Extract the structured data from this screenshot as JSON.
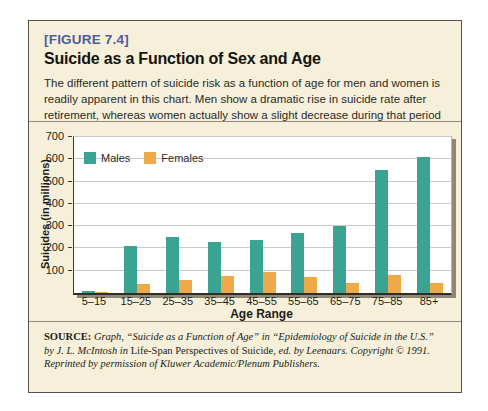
{
  "figure": {
    "label": "[FIGURE 7.4]",
    "title": "Suicide as a Function of Sex and Age",
    "description": "The different pattern of suicide risk as a function of age for men and women is readily apparent in this chart. Men show a dramatic rise in suicide rate after retirement, whereas women actually show a slight decrease during that period of their life."
  },
  "chart_data": {
    "type": "bar",
    "categories": [
      "5–15",
      "15–25",
      "25–35",
      "35–45",
      "45–55",
      "55–65",
      "65–75",
      "75–85",
      "85+"
    ],
    "series": [
      {
        "name": "Males",
        "color": "#3aa392",
        "values": [
          10,
          210,
          250,
          230,
          240,
          270,
          300,
          550,
          610
        ]
      },
      {
        "name": "Females",
        "color": "#f0a94a",
        "values": [
          5,
          40,
          60,
          75,
          95,
          70,
          45,
          80,
          45
        ]
      }
    ],
    "xlabel": "Age Range",
    "ylabel": "Suicides (in millions)",
    "ylim": [
      0,
      700
    ],
    "ytick_step": 100,
    "grid": true,
    "legend_position": "top-left-inside"
  },
  "source": {
    "label": "SOURCE:",
    "segments": [
      {
        "text": " Graph, “Suicide as a Function of Age” in “Epidemiology of Suicide in the U.S.” by J. L. McIntosh in ",
        "style": "italic"
      },
      {
        "text": "Life-Span Perspectives of Suicide,",
        "style": "roman"
      },
      {
        "text": " ed. by Leenaars. Copyright © 1991. Reprinted by permission of Kluwer Academic/Plenum Publishers.",
        "style": "italic"
      }
    ]
  },
  "colors": {
    "box_background": "#f6f0da",
    "box_border": "#56544a",
    "heading_blue": "#4d5ba3",
    "males_teal": "#3aa392",
    "females_orange": "#f0a94a",
    "gridline": "#c9c9c9",
    "plot_shadow": "#8e8874"
  }
}
